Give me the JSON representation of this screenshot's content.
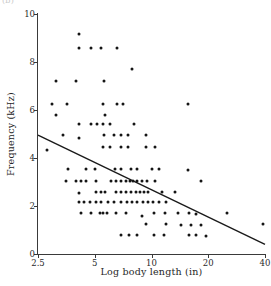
{
  "panel_label": "(b)",
  "chart_data": {
    "type": "scatter",
    "title": "",
    "subtitle": "",
    "xlabel": "Log body length (in)",
    "ylabel": "Frequency (kHz)",
    "xscale": "log",
    "yscale": "linear",
    "xlim": [
      2.5,
      40
    ],
    "ylim": [
      0,
      10
    ],
    "xticks": [
      2.5,
      5,
      10,
      20,
      40
    ],
    "xtick_labels": [
      "2.5",
      "5",
      "10",
      "20",
      "40"
    ],
    "yticks": [
      0,
      2,
      4,
      6,
      8,
      10
    ],
    "ytick_labels": [
      "0",
      "2",
      "4",
      "6",
      "8",
      "10"
    ],
    "grid": false,
    "legend": null,
    "marker": "filled-circle",
    "marker_color": "#151515",
    "axis_color": "#3a3a3a",
    "series": [
      {
        "name": "observations",
        "points": [
          [
            4.15,
            9.15
          ],
          [
            4.15,
            8.6
          ],
          [
            4.75,
            8.6
          ],
          [
            5.4,
            8.6
          ],
          [
            6.6,
            8.6
          ],
          [
            7.9,
            7.7
          ],
          [
            3.1,
            7.2
          ],
          [
            4.0,
            7.2
          ],
          [
            5.6,
            7.2
          ],
          [
            2.95,
            6.25
          ],
          [
            3.55,
            6.25
          ],
          [
            5.55,
            6.25
          ],
          [
            6.55,
            6.25
          ],
          [
            7.1,
            6.25
          ],
          [
            15.6,
            6.25
          ],
          [
            3.1,
            5.8
          ],
          [
            5.7,
            5.8
          ],
          [
            4.1,
            5.4
          ],
          [
            4.75,
            5.4
          ],
          [
            5.15,
            5.4
          ],
          [
            5.55,
            5.4
          ],
          [
            6.0,
            5.4
          ],
          [
            8.1,
            5.4
          ],
          [
            3.4,
            4.95
          ],
          [
            4.1,
            4.85
          ],
          [
            5.6,
            4.95
          ],
          [
            6.3,
            4.95
          ],
          [
            6.9,
            4.95
          ],
          [
            7.5,
            4.95
          ],
          [
            9.3,
            4.95
          ],
          [
            2.8,
            4.35
          ],
          [
            5.5,
            4.45
          ],
          [
            6.0,
            4.45
          ],
          [
            6.9,
            4.45
          ],
          [
            7.5,
            4.45
          ],
          [
            9.3,
            4.45
          ],
          [
            10.4,
            4.45
          ],
          [
            3.6,
            3.55
          ],
          [
            4.5,
            3.55
          ],
          [
            5.0,
            3.55
          ],
          [
            6.4,
            3.55
          ],
          [
            6.9,
            3.55
          ],
          [
            7.8,
            3.55
          ],
          [
            8.4,
            3.55
          ],
          [
            10.1,
            3.55
          ],
          [
            10.9,
            3.55
          ],
          [
            15.6,
            3.5
          ],
          [
            3.5,
            3.05
          ],
          [
            4.0,
            3.05
          ],
          [
            4.25,
            3.05
          ],
          [
            4.5,
            3.05
          ],
          [
            5.1,
            3.05
          ],
          [
            6.1,
            3.05
          ],
          [
            6.5,
            3.05
          ],
          [
            6.9,
            3.05
          ],
          [
            7.3,
            3.05
          ],
          [
            7.7,
            3.05
          ],
          [
            8.0,
            3.05
          ],
          [
            8.4,
            3.05
          ],
          [
            8.9,
            3.05
          ],
          [
            9.5,
            3.05
          ],
          [
            10.4,
            3.05
          ],
          [
            18.3,
            3.05
          ],
          [
            4.1,
            2.55
          ],
          [
            5.1,
            2.6
          ],
          [
            5.4,
            2.6
          ],
          [
            5.7,
            2.6
          ],
          [
            6.5,
            2.6
          ],
          [
            6.9,
            2.6
          ],
          [
            7.3,
            2.6
          ],
          [
            7.8,
            2.6
          ],
          [
            8.3,
            2.6
          ],
          [
            8.7,
            2.6
          ],
          [
            9.1,
            2.6
          ],
          [
            9.6,
            2.6
          ],
          [
            11.3,
            2.6
          ],
          [
            13.3,
            2.6
          ],
          [
            4.1,
            2.15
          ],
          [
            4.4,
            2.15
          ],
          [
            4.7,
            2.15
          ],
          [
            5.1,
            2.15
          ],
          [
            5.4,
            2.15
          ],
          [
            5.9,
            2.15
          ],
          [
            6.3,
            2.15
          ],
          [
            6.9,
            2.15
          ],
          [
            7.4,
            2.15
          ],
          [
            7.9,
            2.15
          ],
          [
            8.4,
            2.15
          ],
          [
            9.0,
            2.15
          ],
          [
            9.6,
            2.15
          ],
          [
            10.2,
            2.15
          ],
          [
            11.0,
            2.15
          ],
          [
            11.9,
            2.15
          ],
          [
            4.25,
            1.7
          ],
          [
            4.8,
            1.7
          ],
          [
            5.3,
            1.7
          ],
          [
            5.55,
            1.7
          ],
          [
            5.8,
            1.7
          ],
          [
            6.5,
            1.7
          ],
          [
            7.3,
            1.7
          ],
          [
            8.9,
            1.6
          ],
          [
            10.3,
            1.7
          ],
          [
            11.8,
            1.7
          ],
          [
            13.8,
            1.7
          ],
          [
            15.8,
            1.7
          ],
          [
            17.2,
            1.65
          ],
          [
            25.0,
            1.7
          ],
          [
            9.3,
            1.25
          ],
          [
            11.9,
            1.25
          ],
          [
            14.4,
            1.2
          ],
          [
            16.2,
            1.2
          ],
          [
            18.3,
            1.2
          ],
          [
            39.0,
            1.25
          ],
          [
            6.9,
            0.78
          ],
          [
            7.6,
            0.78
          ],
          [
            8.4,
            0.78
          ],
          [
            10.3,
            0.78
          ],
          [
            11.6,
            0.78
          ],
          [
            15.8,
            0.78
          ],
          [
            17.3,
            0.78
          ],
          [
            19.5,
            0.75
          ]
        ]
      }
    ],
    "trendline": {
      "name": "least-squares fit",
      "x_start": 2.5,
      "y_start": 4.95,
      "x_end": 40,
      "y_end": 0.4,
      "color": "#1a1a1a",
      "width": 1.4
    }
  }
}
